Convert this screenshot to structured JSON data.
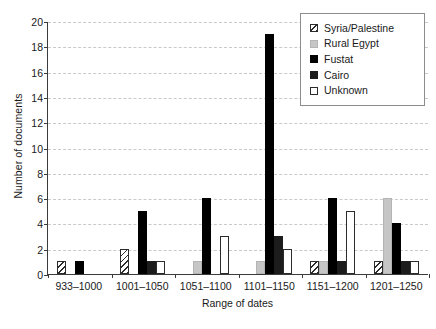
{
  "chart_data": {
    "type": "bar",
    "title": "",
    "xlabel": "Range of dates",
    "ylabel": "Number of documents",
    "categories": [
      "933–1000",
      "1001–1050",
      "1051–1100",
      "1101–1150",
      "1151–1200",
      "1201–1250"
    ],
    "series": [
      {
        "name": "Syria/Palestine",
        "color": "#ffffff",
        "pattern": "diagonal-hatch",
        "values": [
          1,
          2,
          0,
          0,
          1,
          1
        ]
      },
      {
        "name": "Rural Egypt",
        "color": "#c6c6c6",
        "pattern": "solid",
        "values": [
          0,
          0,
          1,
          1,
          1,
          6
        ]
      },
      {
        "name": "Fustat",
        "color": "#000000",
        "pattern": "solid",
        "values": [
          1,
          5,
          6,
          19,
          6,
          4
        ]
      },
      {
        "name": "Cairo",
        "color": "#1c1c1c",
        "pattern": "solid",
        "values": [
          0,
          1,
          0,
          3,
          1,
          1
        ]
      },
      {
        "name": "Unknown",
        "color": "#ffffff",
        "pattern": "outline",
        "values": [
          0,
          1,
          3,
          2,
          5,
          1
        ]
      }
    ],
    "ylim": [
      0,
      20
    ],
    "yticks": [
      0,
      2,
      4,
      6,
      8,
      10,
      12,
      14,
      16,
      18,
      20
    ],
    "grid": true,
    "legend_position": "top-right"
  },
  "legend": {
    "items": [
      {
        "label": "Syria/Palestine"
      },
      {
        "label": "Rural Egypt"
      },
      {
        "label": "Fustat"
      },
      {
        "label": "Cairo"
      },
      {
        "label": "Unknown"
      }
    ]
  }
}
